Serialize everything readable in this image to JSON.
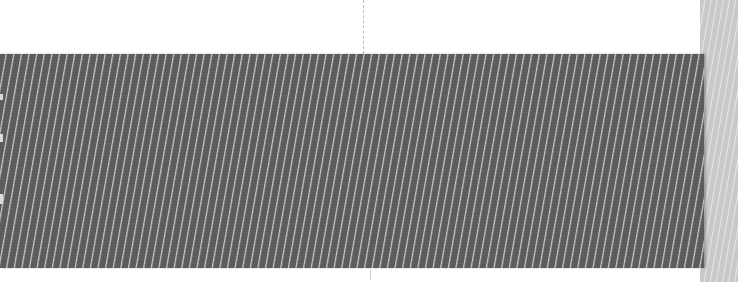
{
  "image": {
    "description": "Close-up photo of a dark grey woven fabric ribbon with fine diagonal light threads, overlapping a light grey fabric strip on the right edge",
    "colors": {
      "background": "#ffffff",
      "dark_fabric": "#5e5e5e",
      "thread_highlight": "#ebebeb",
      "light_fabric": "#c9c9c9",
      "guide_line": "#bdbdbd"
    }
  }
}
